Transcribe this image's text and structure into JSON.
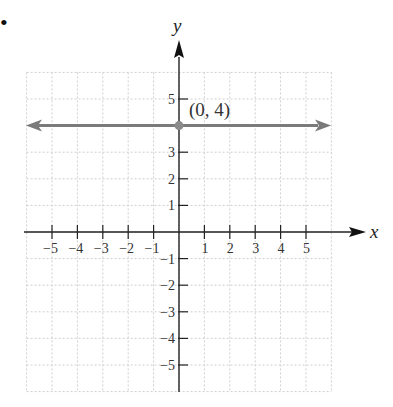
{
  "bullet": "•",
  "chart_data": {
    "type": "line",
    "title": "",
    "xlabel": "x",
    "ylabel": "y",
    "xlim": [
      -6,
      6
    ],
    "ylim": [
      -6,
      6
    ],
    "grid": true,
    "x_ticks": [
      -5,
      -4,
      -3,
      -2,
      -1,
      1,
      2,
      3,
      4,
      5
    ],
    "y_ticks": [
      -5,
      -4,
      -3,
      -2,
      -1,
      1,
      2,
      3,
      5
    ],
    "x_tick_labels": [
      "−5",
      "−4",
      "−3",
      "−2",
      "−1",
      "1",
      "2",
      "3",
      "4",
      "5"
    ],
    "y_tick_labels": [
      "−5",
      "−4",
      "−3",
      "−2",
      "−1",
      "1",
      "2",
      "3",
      "5"
    ],
    "series": [
      {
        "name": "y = 4",
        "type": "horizontal-line",
        "y": 4,
        "x": [
          -6,
          6
        ],
        "color": "#7a7a7a",
        "arrows": "both"
      }
    ],
    "annotations": [
      {
        "point": [
          0,
          4
        ],
        "label": "(0, 4)",
        "marker_color": "#8a8a8a"
      }
    ]
  }
}
